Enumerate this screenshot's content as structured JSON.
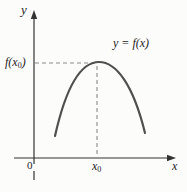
{
  "figure": {
    "background": "#fcfcfb",
    "colors": {
      "curve": "#4f4f4f",
      "axis": "#333333",
      "dash": "#8a8a8a",
      "text": "#222222"
    },
    "labels": {
      "y_axis": "y",
      "x_axis": "x",
      "origin": "0",
      "curve_equation": "y = f(x)",
      "fx0_pre": "f(x",
      "fx0_sub": "0",
      "fx0_post": ")",
      "x0_base": "x",
      "x0_sub": "0"
    }
  }
}
